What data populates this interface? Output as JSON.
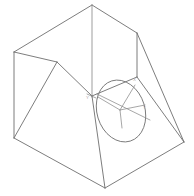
{
  "figure": {
    "title": "Isometric wireframe of an inclined-face block with circular hole",
    "type": "technical-line-drawing",
    "canvas": {
      "width": 194,
      "height": 196,
      "background": "#ffffff"
    },
    "style": {
      "edge_color": "#6e6e6e",
      "soft_edge_color": "#8d8d8d",
      "hole_color": "#7a7a7a",
      "axis_color": "#909090",
      "label_color": "#b0a8a8",
      "stroke_width": 0.9
    }
  },
  "vertices": {
    "apex_top": {
      "x": 92,
      "y": 5,
      "label": "A"
    },
    "left_upper": {
      "x": 14,
      "y": 52,
      "label": "B"
    },
    "right_upper": {
      "x": 137,
      "y": 33,
      "label": "C"
    },
    "back_inner": {
      "x": 57,
      "y": 62,
      "label": "D"
    },
    "center_junction": {
      "x": 92,
      "y": 96,
      "label": "E"
    },
    "right_inner": {
      "x": 137,
      "y": 77,
      "label": "F"
    },
    "left_lower": {
      "x": 14,
      "y": 138,
      "label": "G"
    },
    "bottom_front": {
      "x": 105,
      "y": 188,
      "label": "H"
    },
    "right_lower": {
      "x": 184,
      "y": 142,
      "label": "I"
    },
    "right_mid": {
      "x": 181,
      "y": 140,
      "label": "J"
    }
  },
  "edges": [
    {
      "name": "apex-to-left-upper",
      "from": "apex_top",
      "to": "left_upper"
    },
    {
      "name": "apex-to-right-upper",
      "from": "apex_top",
      "to": "right_upper"
    },
    {
      "name": "apex-vertical-to-junction",
      "from": "apex_top",
      "to": "center_junction"
    },
    {
      "name": "left-upper-to-back-inner",
      "from": "left_upper",
      "to": "back_inner"
    },
    {
      "name": "back-inner-to-junction",
      "from": "back_inner",
      "to": "center_junction"
    },
    {
      "name": "junction-to-right-inner",
      "from": "center_junction",
      "to": "right_inner"
    },
    {
      "name": "right-inner-to-right-upper",
      "from": "right_inner",
      "to": "right_upper"
    },
    {
      "name": "left-upper-to-left-lower",
      "from": "left_upper",
      "to": "left_lower"
    },
    {
      "name": "left-lower-to-bottom-front",
      "from": "left_lower",
      "to": "bottom_front"
    },
    {
      "name": "bottom-front-to-right-lower",
      "from": "bottom_front",
      "to": "right_lower"
    },
    {
      "name": "right-upper-to-right-lower",
      "from": "right_upper",
      "to": "right_lower"
    },
    {
      "name": "back-inner-to-left-lower",
      "from": "back_inner",
      "to": "left_lower"
    },
    {
      "name": "inclined-face-diagonal",
      "from": "center_junction",
      "to": "bottom_front"
    },
    {
      "name": "inclined-face-right-edge",
      "from": "right_inner",
      "to": "right_lower"
    }
  ],
  "hole": {
    "name": "circular-hole",
    "shape": "ellipse",
    "center": {
      "x": 121,
      "y": 111
    },
    "radius_x": 24,
    "radius_y": 31.5,
    "rotation_deg": -17
  },
  "axis_indicator": {
    "name": "local-coordinate-axes",
    "origin": {
      "x": 120,
      "y": 110
    },
    "axes": [
      {
        "name": "x-axis",
        "label": "X",
        "tip": {
          "x": 135,
          "y": 85
        },
        "label_pos": {
          "x": 133,
          "y": 81
        }
      },
      {
        "name": "y-axis",
        "label": "Y",
        "tip": {
          "x": 145,
          "y": 105
        },
        "label_pos": {
          "x": 143,
          "y": 109
        }
      },
      {
        "name": "z-axis",
        "label": "Z",
        "tip": {
          "x": 122,
          "y": 128
        },
        "label_pos": {
          "x": 120,
          "y": 133
        }
      }
    ]
  },
  "secondary_axis_marker": {
    "name": "back-origin-marker",
    "origin": {
      "x": 92,
      "y": 96
    },
    "label": "Y",
    "label_pos": {
      "x": 88,
      "y": 98
    }
  },
  "hole_chord": {
    "name": "hole-chord-line",
    "from": {
      "x": 97,
      "y": 94
    },
    "to": {
      "x": 150,
      "y": 120
    }
  }
}
